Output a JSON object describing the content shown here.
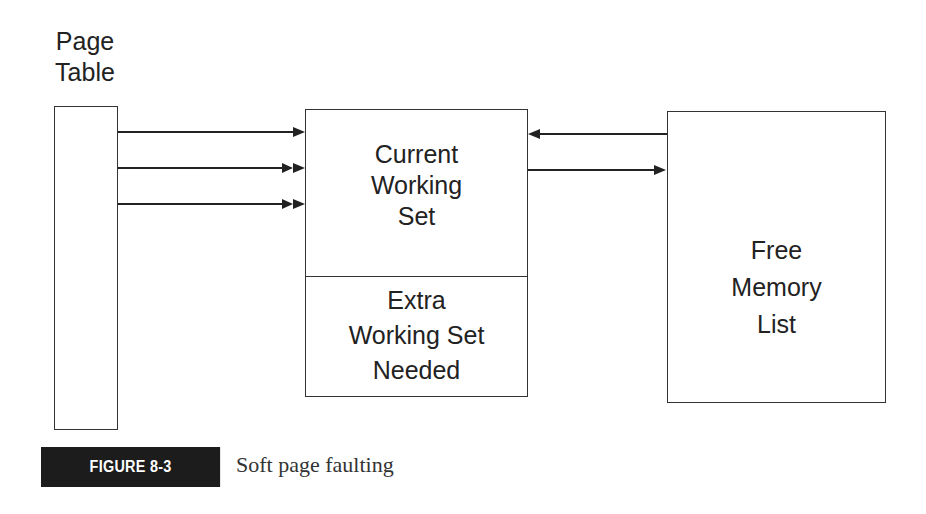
{
  "diagram": {
    "page_table": {
      "title_line1": "Page",
      "title_line2": "Table"
    },
    "working_set": {
      "current": {
        "line1": "Current",
        "line2": "Working",
        "line3": "Set"
      },
      "extra": {
        "line1": "Extra",
        "line2": "Working Set",
        "line3": "Needed"
      }
    },
    "free_memory": {
      "line1": "Free",
      "line2": "Memory",
      "line3": "List"
    },
    "arrows": [
      {
        "from": "page_table",
        "to": "current_working_set",
        "head": "single"
      },
      {
        "from": "page_table",
        "to": "current_working_set",
        "head": "double"
      },
      {
        "from": "page_table",
        "to": "current_working_set",
        "head": "double"
      },
      {
        "from": "free_memory_list",
        "to": "current_working_set",
        "head": "single"
      },
      {
        "from": "current_working_set",
        "to": "free_memory_list",
        "head": "single"
      }
    ]
  },
  "figure": {
    "label": "FIGURE 8-3",
    "caption": "Soft page faulting"
  }
}
